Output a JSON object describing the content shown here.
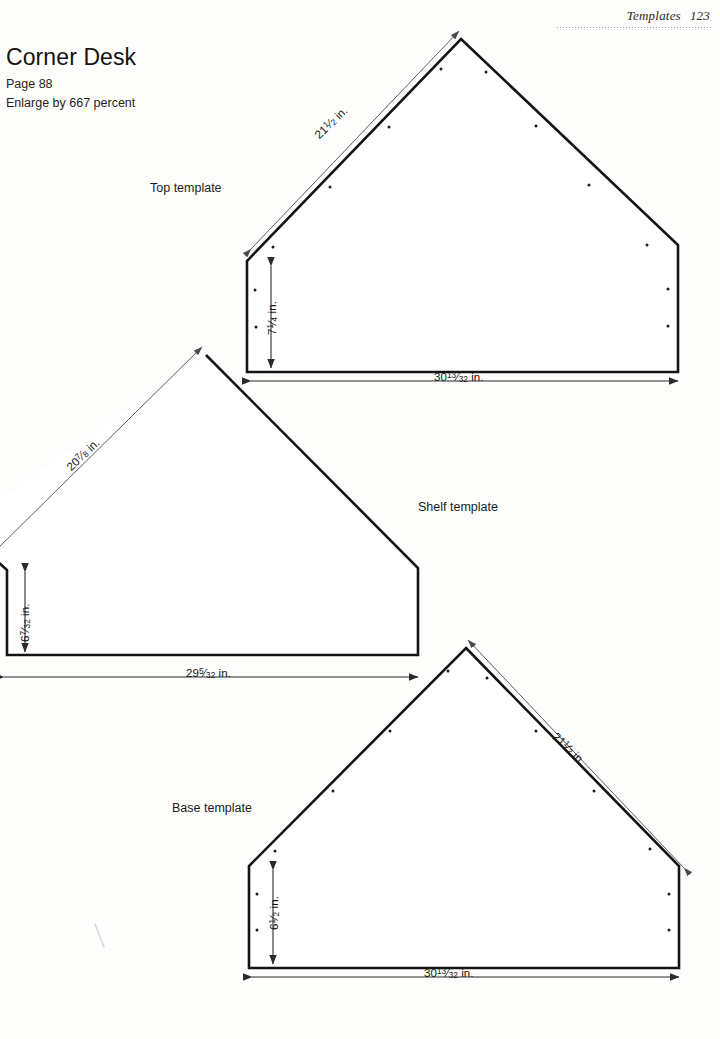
{
  "header": {
    "section": "Templates",
    "page_number": "123"
  },
  "title": "Corner Desk",
  "page_ref": "Page 88",
  "enlarge_note": "Enlarge by 667 percent",
  "templates": [
    {
      "name": "top",
      "caption": "Top template",
      "dimensions": {
        "diagonal": {
          "whole": "21",
          "num": "1",
          "den": "2",
          "unit": "in."
        },
        "vertical": {
          "whole": "7",
          "num": "1",
          "den": "4",
          "unit": "in."
        },
        "horizontal": {
          "whole": "30",
          "num": "13",
          "den": "32",
          "unit": "in."
        }
      }
    },
    {
      "name": "shelf",
      "caption": "Shelf template",
      "dimensions": {
        "diagonal": {
          "whole": "20",
          "num": "7",
          "den": "8",
          "unit": "in."
        },
        "vertical": {
          "whole": "6",
          "num": "7",
          "den": "32",
          "unit": "in."
        },
        "horizontal": {
          "whole": "29",
          "num": "5",
          "den": "32",
          "unit": "in."
        }
      }
    },
    {
      "name": "base",
      "caption": "Base template",
      "dimensions": {
        "diagonal": {
          "whole": "21",
          "num": "1",
          "den": "2",
          "unit": "in."
        },
        "vertical": {
          "whole": "6",
          "num": "1",
          "den": "2",
          "unit": "in."
        },
        "horizontal": {
          "whole": "30",
          "num": "13",
          "den": "32",
          "unit": "in."
        }
      }
    }
  ],
  "colors": {
    "page_background": "#fdfdfb",
    "outline": "#141414",
    "dimension_line": "#4a4a4a",
    "text": "#1a1a1a"
  }
}
